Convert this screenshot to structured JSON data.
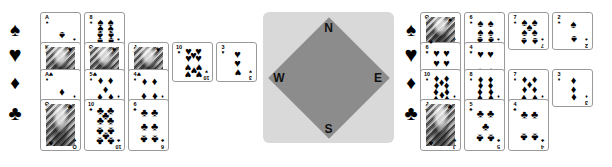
{
  "diagram": {
    "type": "bridge-hand-diagram",
    "suit_glyphs": {
      "spade": "♠",
      "heart": "♥",
      "diamond": "♦",
      "club": "♣"
    },
    "suit_order": [
      "spade",
      "heart",
      "diamond",
      "club"
    ]
  },
  "compass": {
    "north_label": "N",
    "south_label": "S",
    "west_label": "W",
    "east_label": "E",
    "plate_color": "#d9d9d9",
    "diamond_color": "#8c8c8c"
  },
  "left_hand": {
    "name": "west-hand",
    "suit_markers": [
      {
        "suit": "spade",
        "glyph": "♠"
      },
      {
        "suit": "heart",
        "glyph": "♥"
      },
      {
        "suit": "diamond",
        "glyph": "♦"
      },
      {
        "suit": "club",
        "glyph": "♣"
      }
    ],
    "rows": [
      {
        "suit": "spade",
        "glyph": "♠",
        "cards": [
          {
            "rank": "A",
            "rank_label": "A",
            "count": 1,
            "court": false
          },
          {
            "rank": "8",
            "rank_label": "8",
            "count": 8,
            "court": false
          }
        ]
      },
      {
        "suit": "heart",
        "glyph": "♥",
        "cards": [
          {
            "rank": "K",
            "rank_label": "K",
            "count": 0,
            "court": true
          },
          {
            "rank": "Q",
            "rank_label": "Q",
            "count": 0,
            "court": true
          },
          {
            "rank": "J",
            "rank_label": "J",
            "count": 0,
            "court": true
          },
          {
            "rank": "10",
            "rank_label": "10",
            "count": 10,
            "court": false
          },
          {
            "rank": "3",
            "rank_label": "3",
            "count": 3,
            "court": false
          }
        ]
      },
      {
        "suit": "diamond",
        "glyph": "♦",
        "cards": [
          {
            "rank": "A",
            "rank_label": "A",
            "count": 1,
            "court": false
          },
          {
            "rank": "5",
            "rank_label": "5",
            "count": 5,
            "court": false
          },
          {
            "rank": "4",
            "rank_label": "4",
            "count": 4,
            "court": false
          }
        ]
      },
      {
        "suit": "club",
        "glyph": "♣",
        "cards": [
          {
            "rank": "Q",
            "rank_label": "Q",
            "count": 0,
            "court": true
          },
          {
            "rank": "10",
            "rank_label": "10",
            "count": 10,
            "court": false
          },
          {
            "rank": "6",
            "rank_label": "6",
            "count": 6,
            "court": false
          }
        ]
      }
    ]
  },
  "right_hand": {
    "name": "east-hand",
    "suit_markers": [
      {
        "suit": "spade",
        "glyph": "♠"
      },
      {
        "suit": "heart",
        "glyph": "♥"
      },
      {
        "suit": "diamond",
        "glyph": "♦"
      },
      {
        "suit": "club",
        "glyph": "♣"
      }
    ],
    "rows": [
      {
        "suit": "spade",
        "glyph": "♠",
        "cards": [
          {
            "rank": "Q",
            "rank_label": "Q",
            "count": 0,
            "court": true
          },
          {
            "rank": "6",
            "rank_label": "6",
            "count": 6,
            "court": false
          },
          {
            "rank": "7",
            "rank_label": "7",
            "count": 7,
            "court": false
          },
          {
            "rank": "2",
            "rank_label": "2",
            "count": 2,
            "court": false
          }
        ]
      },
      {
        "suit": "heart",
        "glyph": "♥",
        "cards": [
          {
            "rank": "6",
            "rank_label": "6",
            "count": 6,
            "court": false
          },
          {
            "rank": "4",
            "rank_label": "4",
            "count": 4,
            "court": false
          }
        ]
      },
      {
        "suit": "diamond",
        "glyph": "♦",
        "cards": [
          {
            "rank": "10",
            "rank_label": "10",
            "count": 10,
            "court": false
          },
          {
            "rank": "8",
            "rank_label": "8",
            "count": 8,
            "court": false
          },
          {
            "rank": "7",
            "rank_label": "7",
            "count": 7,
            "court": false
          },
          {
            "rank": "3",
            "rank_label": "3",
            "count": 3,
            "court": false
          }
        ]
      },
      {
        "suit": "club",
        "glyph": "♣",
        "cards": [
          {
            "rank": "J",
            "rank_label": "J",
            "count": 0,
            "court": true
          },
          {
            "rank": "5",
            "rank_label": "5",
            "count": 5,
            "court": false
          },
          {
            "rank": "4",
            "rank_label": "4",
            "count": 4,
            "court": false
          }
        ]
      }
    ]
  },
  "layout": {
    "card_width": 41,
    "card_height": 37,
    "card_gap_x": 3,
    "left_group_x": 40,
    "right_group_x": 420,
    "row_y": [
      12,
      42,
      69,
      99
    ],
    "row_heights": [
      38,
      40,
      38,
      52
    ],
    "left_suitcol_x": 2,
    "right_suitcol_x": 398,
    "suit_y": [
      20,
      44,
      73,
      103
    ],
    "compass_x": 263,
    "compass_y": 12,
    "compass_size": 131
  }
}
